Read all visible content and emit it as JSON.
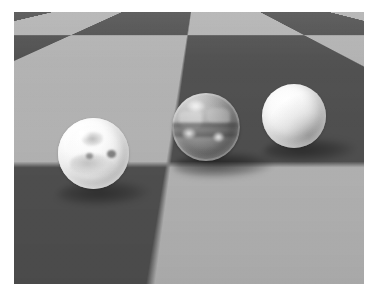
{
  "image": {
    "kind": "rendered-3d-scene",
    "description": "Three spheres resting on a receding checkerboard floor, grayscale raytraced render",
    "width_px": 376,
    "height_px": 294,
    "border": {
      "color": "#ffffff",
      "left_px": 14,
      "top_px": 12,
      "right_px": 12,
      "bottom_px": 10
    },
    "palette": {
      "checker_light": "#b2b2b2",
      "checker_dark": "#4f4f4f",
      "sphere_white": "#ffffff",
      "sphere_glass_mid": "#8e8e8e",
      "shadow": "#000000",
      "background": "#ffffff"
    }
  },
  "floor": {
    "name": "checkerboard-floor",
    "pattern": "checkerboard",
    "light_square_color": "#b2b2b2",
    "dark_square_color": "#4f4f4f",
    "tile_size_px": 138,
    "perspective_px": 165,
    "tilt_deg": 78.5
  },
  "objects": [
    {
      "id": "sphere-frosted",
      "label": "Frosted translucent sphere",
      "material": "frosted / translucent white glass with internal inclusions",
      "center_x": 93,
      "center_y": 153,
      "diameter_px": 71,
      "base_color": "#f2f2f2"
    },
    {
      "id": "sphere-glass",
      "label": "Clear glass sphere",
      "material": "transparent refracting glass showing the floor through it",
      "center_x": 206,
      "center_y": 127,
      "diameter_px": 68,
      "base_color": "#8e8e8e"
    },
    {
      "id": "sphere-matte",
      "label": "Matte opaque sphere",
      "material": "diffuse opaque white lambertian",
      "center_x": 294,
      "center_y": 116,
      "diameter_px": 64,
      "base_color": "#fafafa"
    }
  ],
  "shadows": [
    {
      "id": "shadow-frosted",
      "belongs_to": "sphere-frosted",
      "opacity": 0.42
    },
    {
      "id": "shadow-glass",
      "belongs_to": "sphere-glass",
      "opacity": 0.55
    },
    {
      "id": "shadow-matte",
      "belongs_to": "sphere-matte",
      "opacity": 0.46
    }
  ],
  "lighting": {
    "key_light_direction": "upper-left",
    "specular_highlight_position": "upper-left of each sphere"
  }
}
